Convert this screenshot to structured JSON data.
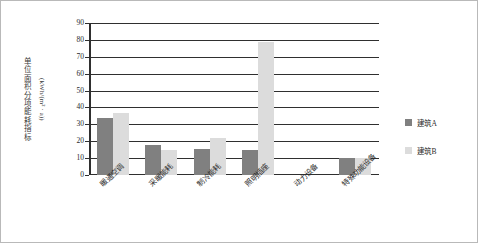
{
  "chart_data": {
    "type": "bar",
    "title": "",
    "subtitle": "",
    "xlabel": "",
    "ylabel": "单位面积分项能耗指标",
    "ylabel_unit": "(kWh/(m² · a))",
    "categories": [
      "暖通空调",
      "采暖能耗",
      "制冷能耗",
      "照明插座",
      "动力设备",
      "特殊功能设备"
    ],
    "series": [
      {
        "name": "建筑A",
        "color": "#808080",
        "values": [
          33.5,
          18,
          15.5,
          15,
          0,
          10
        ]
      },
      {
        "name": "建筑B",
        "color": "#dcdcdc",
        "values": [
          37,
          15,
          22,
          79,
          0,
          10
        ]
      }
    ],
    "ylim": [
      0,
      90
    ],
    "ytick_step": 10,
    "yticks": [
      0,
      10,
      20,
      30,
      40,
      50,
      60,
      70,
      80,
      90
    ],
    "ytick_labels": [
      "0",
      "10",
      "20",
      "30",
      "40",
      "50",
      "60",
      "70",
      "80",
      "90"
    ],
    "grid": true,
    "grid_axis": "y",
    "legend_position": "right",
    "annotations": []
  },
  "legend": {
    "items": [
      {
        "label": "建筑A",
        "color": "#808080"
      },
      {
        "label": "建筑B",
        "color": "#dcdcdc"
      }
    ]
  },
  "colors": {
    "series_a": "#808080",
    "series_b": "#dcdcdc",
    "axis": "#2f2f2f",
    "grid": "#2f2f2f",
    "frame": "#b9b9b9",
    "text": "#2b2b2b",
    "background": "#ffffff"
  }
}
